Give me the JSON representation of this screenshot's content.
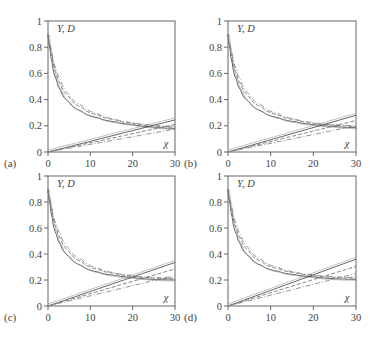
{
  "figure": {
    "width": 373,
    "height": 342
  },
  "chart_data": [
    {
      "type": "line",
      "panel_label": "(a)",
      "ylabel": "Y, D",
      "xlabel": "χ",
      "xlim": [
        0,
        30
      ],
      "ylim": [
        0,
        1
      ],
      "xticks": [
        "0",
        "10",
        "20",
        "30"
      ],
      "yticks": [
        "0",
        "0.2",
        "0.4",
        "0.6",
        "0.8",
        "1"
      ],
      "grid": false,
      "box": {
        "left": 48,
        "right": 175,
        "top": 21,
        "bottom": 152
      },
      "curves": {
        "Y_end": 0.18,
        "Y_spread": 0.02,
        "D_end": 0.245,
        "D_spread": 0.07
      },
      "series": [
        {
          "name": "Y solid",
          "style": "solid",
          "x": [
            0,
            0.5,
            1,
            2,
            3,
            5,
            8,
            12,
            16,
            20,
            25,
            30
          ],
          "y": [
            0.9,
            0.78,
            0.68,
            0.55,
            0.47,
            0.38,
            0.31,
            0.26,
            0.23,
            0.21,
            0.19,
            0.18
          ]
        },
        {
          "name": "Y dashed",
          "style": "dashed",
          "x": [
            0,
            0.5,
            1,
            2,
            3,
            5,
            8,
            12,
            16,
            20,
            25,
            30
          ],
          "y": [
            0.9,
            0.8,
            0.72,
            0.6,
            0.52,
            0.42,
            0.34,
            0.28,
            0.245,
            0.22,
            0.2,
            0.19
          ]
        },
        {
          "name": "Y dash-dot",
          "style": "dashdot",
          "x": [
            0,
            0.5,
            1,
            2,
            3,
            5,
            8,
            12,
            16,
            20,
            25,
            30
          ],
          "y": [
            0.9,
            0.82,
            0.75,
            0.63,
            0.55,
            0.44,
            0.355,
            0.29,
            0.25,
            0.225,
            0.205,
            0.195
          ]
        },
        {
          "name": "D solid",
          "style": "solid",
          "x": [
            0,
            30
          ],
          "y": [
            0,
            0.245
          ]
        },
        {
          "name": "D dashed",
          "style": "dashed",
          "x": [
            0,
            30
          ],
          "y": [
            0,
            0.21
          ]
        },
        {
          "name": "D dash-dot",
          "style": "dashdot",
          "x": [
            0,
            30
          ],
          "y": [
            0,
            0.175
          ]
        }
      ]
    },
    {
      "type": "line",
      "panel_label": "(b)",
      "ylabel": "Y, D",
      "xlabel": "χ",
      "xlim": [
        0,
        30
      ],
      "ylim": [
        0,
        1
      ],
      "xticks": [
        "0",
        "10",
        "20",
        "30"
      ],
      "yticks": [
        "0",
        "0.2",
        "0.4",
        "0.6",
        "0.8",
        "1"
      ],
      "grid": false,
      "box": {
        "left": 228,
        "right": 356,
        "top": 21,
        "bottom": 152
      },
      "curves": {
        "Y_end": 0.185,
        "Y_spread": 0.02,
        "D_end": 0.28,
        "D_spread": 0.08
      },
      "series": [
        {
          "name": "Y solid",
          "style": "solid",
          "x": [
            0,
            0.5,
            1,
            2,
            3,
            5,
            8,
            12,
            16,
            20,
            25,
            30
          ],
          "y": [
            0.9,
            0.78,
            0.68,
            0.55,
            0.47,
            0.38,
            0.31,
            0.26,
            0.23,
            0.21,
            0.195,
            0.185
          ]
        },
        {
          "name": "Y dashed",
          "style": "dashed",
          "x": [
            0,
            0.5,
            1,
            2,
            3,
            5,
            8,
            12,
            16,
            20,
            25,
            30
          ],
          "y": [
            0.9,
            0.8,
            0.72,
            0.6,
            0.52,
            0.42,
            0.34,
            0.28,
            0.245,
            0.22,
            0.205,
            0.195
          ]
        },
        {
          "name": "Y dash-dot",
          "style": "dashdot",
          "x": [
            0,
            0.5,
            1,
            2,
            3,
            5,
            8,
            12,
            16,
            20,
            25,
            30
          ],
          "y": [
            0.9,
            0.82,
            0.75,
            0.63,
            0.55,
            0.44,
            0.355,
            0.29,
            0.25,
            0.225,
            0.21,
            0.2
          ]
        },
        {
          "name": "D solid",
          "style": "solid",
          "x": [
            0,
            30
          ],
          "y": [
            0,
            0.28
          ]
        },
        {
          "name": "D dashed",
          "style": "dashed",
          "x": [
            0,
            30
          ],
          "y": [
            0,
            0.24
          ]
        },
        {
          "name": "D dash-dot",
          "style": "dashdot",
          "x": [
            0,
            30
          ],
          "y": [
            0,
            0.2
          ]
        }
      ]
    },
    {
      "type": "line",
      "panel_label": "(c)",
      "ylabel": "Y, D",
      "xlabel": "χ",
      "xlim": [
        0,
        30
      ],
      "ylim": [
        0,
        1
      ],
      "xticks": [
        "0",
        "10",
        "20",
        "30"
      ],
      "yticks": [
        "0",
        "0.2",
        "0.4",
        "0.6",
        "0.8",
        "1"
      ],
      "grid": false,
      "box": {
        "left": 48,
        "right": 175,
        "top": 176,
        "bottom": 306
      },
      "curves": {
        "Y_end": 0.2,
        "Y_spread": 0.02,
        "D_end": 0.335,
        "D_spread": 0.1
      },
      "series": [
        {
          "name": "Y solid",
          "style": "solid",
          "x": [
            0,
            0.5,
            1,
            2,
            3,
            5,
            8,
            12,
            16,
            20,
            25,
            30
          ],
          "y": [
            0.9,
            0.78,
            0.68,
            0.55,
            0.47,
            0.38,
            0.31,
            0.26,
            0.235,
            0.22,
            0.205,
            0.2
          ]
        },
        {
          "name": "Y dashed",
          "style": "dashed",
          "x": [
            0,
            0.5,
            1,
            2,
            3,
            5,
            8,
            12,
            16,
            20,
            25,
            30
          ],
          "y": [
            0.9,
            0.8,
            0.72,
            0.6,
            0.52,
            0.42,
            0.34,
            0.28,
            0.25,
            0.23,
            0.215,
            0.21
          ]
        },
        {
          "name": "Y dash-dot",
          "style": "dashdot",
          "x": [
            0,
            0.5,
            1,
            2,
            3,
            5,
            8,
            12,
            16,
            20,
            25,
            30
          ],
          "y": [
            0.9,
            0.82,
            0.75,
            0.63,
            0.55,
            0.44,
            0.355,
            0.29,
            0.255,
            0.235,
            0.22,
            0.215
          ]
        },
        {
          "name": "D solid",
          "style": "solid",
          "x": [
            0,
            30
          ],
          "y": [
            0,
            0.335
          ]
        },
        {
          "name": "D dashed",
          "style": "dashed",
          "x": [
            0,
            30
          ],
          "y": [
            0,
            0.285
          ]
        },
        {
          "name": "D dash-dot",
          "style": "dashdot",
          "x": [
            0,
            30
          ],
          "y": [
            0,
            0.235
          ]
        }
      ]
    },
    {
      "type": "line",
      "panel_label": "(d)",
      "ylabel": "Y, D",
      "xlabel": "χ",
      "xlim": [
        0,
        30
      ],
      "ylim": [
        0,
        1
      ],
      "xticks": [
        "0",
        "10",
        "20",
        "30"
      ],
      "yticks": [
        "0",
        "0.2",
        "0.4",
        "0.6",
        "0.8",
        "1"
      ],
      "grid": false,
      "box": {
        "left": 228,
        "right": 356,
        "top": 176,
        "bottom": 306
      },
      "curves": {
        "Y_end": 0.205,
        "Y_spread": 0.02,
        "D_end": 0.36,
        "D_spread": 0.11
      },
      "series": [
        {
          "name": "Y solid",
          "style": "solid",
          "x": [
            0,
            0.5,
            1,
            2,
            3,
            5,
            8,
            12,
            16,
            20,
            25,
            30
          ],
          "y": [
            0.9,
            0.78,
            0.68,
            0.55,
            0.47,
            0.38,
            0.31,
            0.265,
            0.24,
            0.225,
            0.21,
            0.205
          ]
        },
        {
          "name": "Y dashed",
          "style": "dashed",
          "x": [
            0,
            0.5,
            1,
            2,
            3,
            5,
            8,
            12,
            16,
            20,
            25,
            30
          ],
          "y": [
            0.9,
            0.8,
            0.72,
            0.6,
            0.52,
            0.42,
            0.34,
            0.285,
            0.255,
            0.235,
            0.22,
            0.215
          ]
        },
        {
          "name": "Y dash-dot",
          "style": "dashdot",
          "x": [
            0,
            0.5,
            1,
            2,
            3,
            5,
            8,
            12,
            16,
            20,
            25,
            30
          ],
          "y": [
            0.9,
            0.82,
            0.75,
            0.63,
            0.55,
            0.44,
            0.355,
            0.295,
            0.26,
            0.24,
            0.225,
            0.22
          ]
        },
        {
          "name": "D solid",
          "style": "solid",
          "x": [
            0,
            30
          ],
          "y": [
            0,
            0.36
          ]
        },
        {
          "name": "D dashed",
          "style": "dashed",
          "x": [
            0,
            30
          ],
          "y": [
            0,
            0.305
          ]
        },
        {
          "name": "D dash-dot",
          "style": "dashdot",
          "x": [
            0,
            30
          ],
          "y": [
            0,
            0.25
          ]
        }
      ]
    }
  ]
}
